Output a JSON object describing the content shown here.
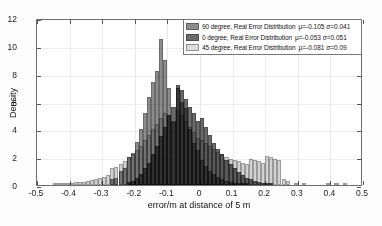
{
  "chart_data": {
    "type": "bar",
    "title": "",
    "subtitle": "",
    "xlabel": "error/m at distance of 5 m",
    "ylabel": "Density",
    "xlim": [
      -0.5,
      0.5
    ],
    "ylim": [
      0,
      12
    ],
    "xticks": [
      "-0.5",
      "-0.4",
      "-0.3",
      "-0.2",
      "-0.1",
      "0",
      "0.1",
      "0.2",
      "0.3",
      "0.4",
      "0.5"
    ],
    "xtick_values": [
      -0.5,
      -0.4,
      -0.3,
      -0.2,
      -0.1,
      0,
      0.1,
      0.2,
      0.3,
      0.4,
      0.5
    ],
    "yticks": [
      "0",
      "2",
      "4",
      "6",
      "8",
      "10",
      "12"
    ],
    "ytick_values": [
      0,
      2,
      4,
      6,
      8,
      10,
      12
    ],
    "grid": true,
    "legend_position": "top-right",
    "bin_width": 0.0125,
    "bin_centers": [
      -0.44375,
      -0.43125,
      -0.41875,
      -0.40625,
      -0.39375,
      -0.38125,
      -0.36875,
      -0.35625,
      -0.34375,
      -0.33125,
      -0.31875,
      -0.30625,
      -0.29375,
      -0.28125,
      -0.26875,
      -0.25625,
      -0.24375,
      -0.23125,
      -0.21875,
      -0.20625,
      -0.19375,
      -0.18125,
      -0.16875,
      -0.15625,
      -0.14375,
      -0.13125,
      -0.11875,
      -0.10625,
      -0.09375,
      -0.08125,
      -0.06875,
      -0.05625,
      -0.04375,
      -0.03125,
      -0.01875,
      -0.00625,
      0.00625,
      0.01875,
      0.03125,
      0.04375,
      0.05625,
      0.06875,
      0.08125,
      0.09375,
      0.10625,
      0.11875,
      0.13125,
      0.14375,
      0.15625,
      0.16875,
      0.18125,
      0.19375,
      0.20625,
      0.21875,
      0.23125,
      0.24375,
      0.25625,
      0.26875,
      0.29375,
      0.31875,
      0.39375,
      0.41875,
      0.44375
    ],
    "series": [
      {
        "name": "90 degree, Real Error Distribution",
        "label": "90 degree, Real Error Distribution",
        "stats": "μ=-0.105  σ=0.041",
        "mu": -0.105,
        "sigma": 0.041,
        "color": "#8c8c8c",
        "values": [
          0,
          0,
          0,
          0,
          0,
          0,
          0,
          0,
          0,
          0,
          0,
          0,
          0,
          0,
          0.4,
          0.5,
          1.0,
          1.2,
          2.0,
          2.3,
          3.1,
          4.0,
          5.2,
          6.3,
          7.4,
          8.2,
          10.5,
          9.0,
          7.0,
          4.5,
          7.0,
          6.0,
          5.5,
          4.0,
          3.0,
          2.5,
          1.8,
          1.4,
          1.0,
          0.8,
          0.6,
          0.4,
          0.3,
          0.2,
          0.15,
          0.1,
          0.08,
          0.05,
          0,
          0,
          0,
          0,
          0,
          0,
          0,
          0,
          0,
          0,
          0,
          0,
          0,
          0,
          0
        ]
      },
      {
        "name": "0 degree, Real Error Distribution",
        "label": "0 degree, Real Error Distribution",
        "stats": "μ=-0.053  σ=0.051",
        "mu": -0.053,
        "sigma": 0.051,
        "color": "#6b6b6b",
        "values": [
          0,
          0,
          0,
          0,
          0,
          0,
          0,
          0,
          0,
          0,
          0,
          0,
          0,
          0,
          0,
          0,
          0,
          0,
          0.2,
          0.3,
          0.5,
          0.8,
          1.2,
          1.6,
          2.2,
          2.8,
          3.5,
          4.2,
          5.0,
          5.6,
          7.2,
          6.8,
          6.2,
          5.6,
          5.2,
          4.6,
          4.8,
          4.2,
          3.6,
          3.0,
          2.6,
          2.2,
          1.8,
          1.5,
          1.2,
          0.9,
          0.7,
          0.5,
          0.4,
          0.3,
          0.2,
          0.15,
          0.1,
          0.05,
          0,
          0,
          0,
          0,
          0,
          0,
          0,
          0,
          0
        ]
      },
      {
        "name": "45 degree, Real Error Distribution",
        "label": "45 degree, Real Error Distribution",
        "stats": "μ=-0.081  σ=0.09",
        "mu": -0.081,
        "sigma": 0.09,
        "color": "#d2d2d2",
        "values": [
          0.05,
          0.05,
          0.1,
          0.1,
          0.15,
          0.2,
          0.2,
          0.25,
          0.3,
          0.35,
          0.4,
          0.5,
          0.6,
          0.7,
          1.2,
          1.3,
          1.5,
          1.7,
          2.0,
          2.2,
          2.5,
          2.8,
          3.2,
          3.6,
          4.0,
          4.4,
          4.8,
          5.2,
          5.0,
          4.6,
          5.4,
          5.0,
          4.6,
          4.2,
          3.8,
          3.4,
          3.2,
          3.0,
          2.8,
          2.6,
          2.4,
          2.2,
          2.0,
          1.9,
          1.8,
          1.7,
          1.6,
          1.5,
          1.9,
          1.8,
          1.7,
          1.6,
          2.1,
          2.0,
          1.9,
          1.8,
          0.4,
          0.3,
          0.15,
          0.12,
          0.08,
          0.06,
          0.05
        ]
      }
    ]
  },
  "axes": {
    "ylabel": "Density",
    "xlabel": "error/m at distance of 5 m"
  }
}
